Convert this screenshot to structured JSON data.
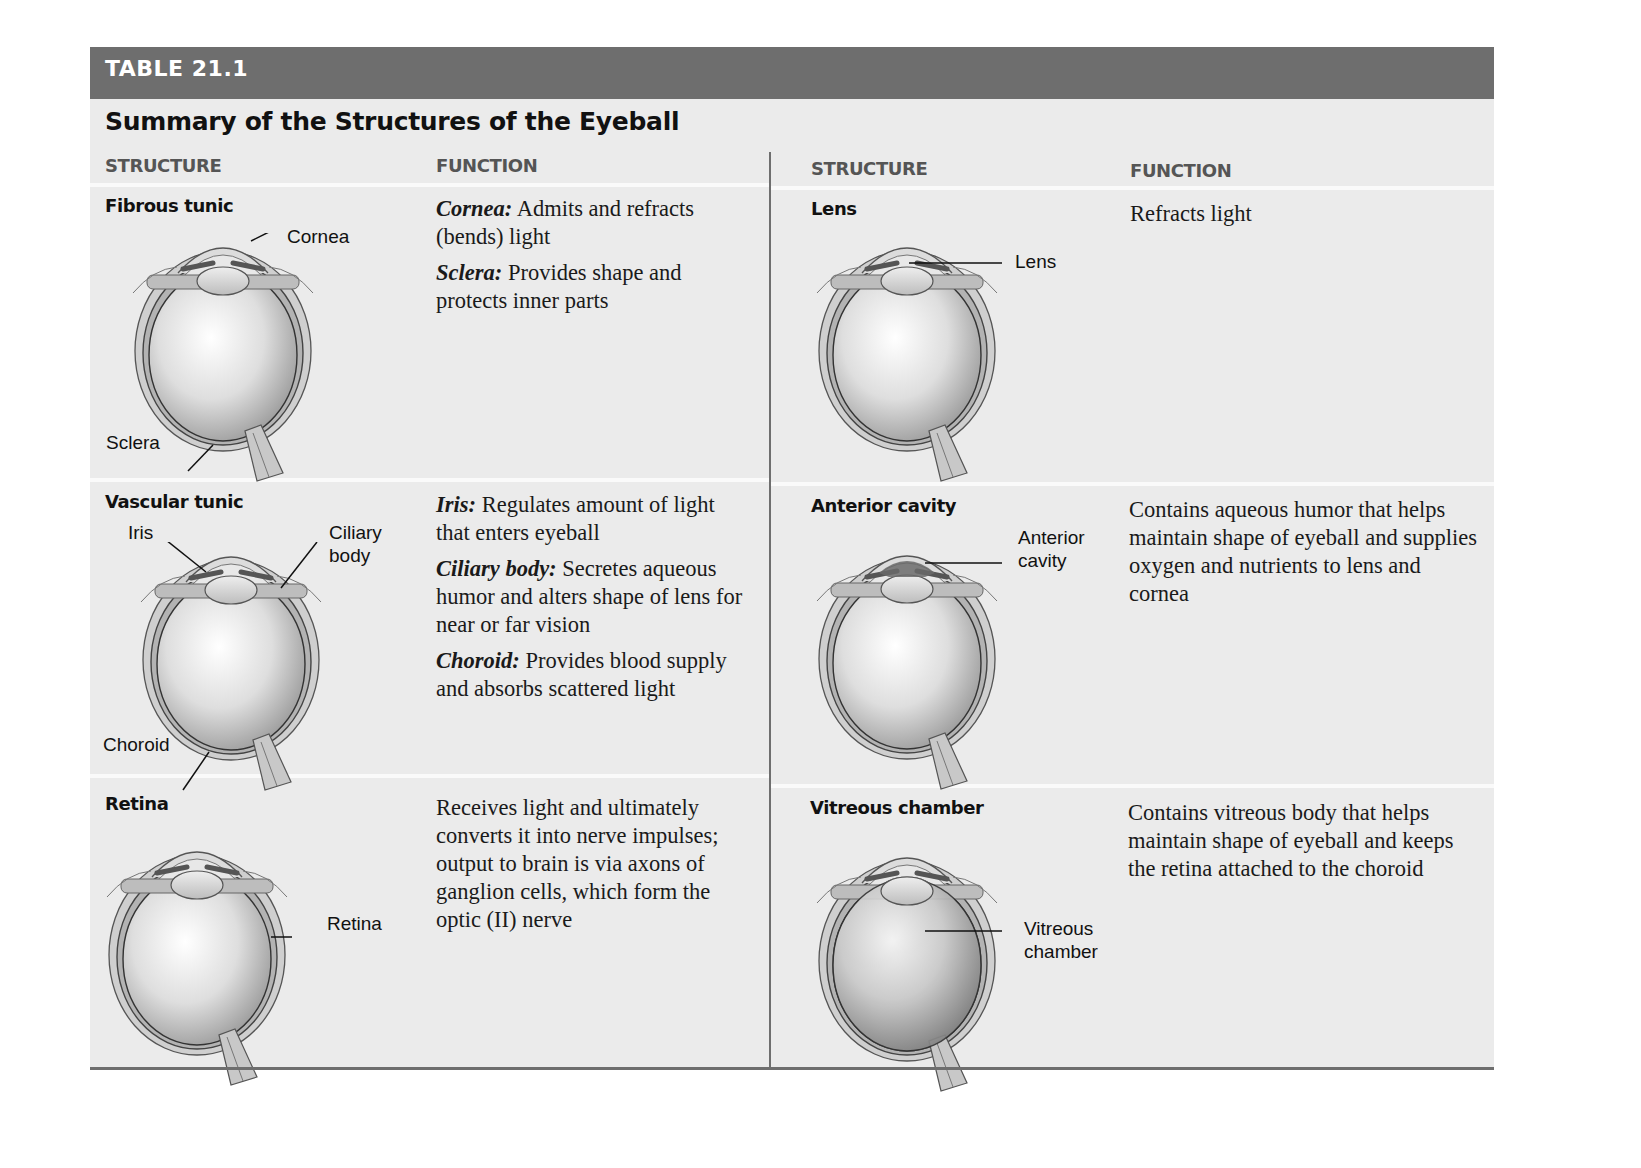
{
  "table": {
    "number": "TABLE 21.1",
    "title": "Summary of the Structures of the Eyeball",
    "columns": {
      "left": {
        "structure": "STRUCTURE",
        "function": "FUNCTION"
      },
      "right": {
        "structure": "STRUCTURE",
        "function": "FUNCTION"
      }
    },
    "rows_left": [
      {
        "structure": "Fibrous tunic",
        "labels": [
          "Cornea",
          "Sclera"
        ],
        "functions": [
          {
            "term": "Cornea:",
            "text": " Admits and refracts (bends) light"
          },
          {
            "term": "Sclera:",
            "text": " Provides shape and protects inner parts"
          }
        ]
      },
      {
        "structure": "Vascular tunic",
        "labels": [
          "Iris",
          "Ciliary body",
          "Choroid"
        ],
        "functions": [
          {
            "term": "Iris:",
            "text": " Regulates amount of light that enters eyeball"
          },
          {
            "term": "Ciliary body:",
            "text": " Secretes aqueous humor and alters shape of lens for near or far vision"
          },
          {
            "term": "Choroid:",
            "text": " Provides blood supply and absorbs scattered light"
          }
        ]
      },
      {
        "structure": "Retina",
        "labels": [
          "Retina"
        ],
        "functions": [
          {
            "term": "",
            "text": "Receives light and ultimately converts it into nerve impulses; output to brain is via axons of ganglion cells, which form the optic (II) nerve"
          }
        ]
      }
    ],
    "rows_right": [
      {
        "structure": "Lens",
        "labels": [
          "Lens"
        ],
        "functions": [
          {
            "term": "",
            "text": "Refracts light"
          }
        ]
      },
      {
        "structure": "Anterior cavity",
        "labels": [
          "Anterior cavity"
        ],
        "functions": [
          {
            "term": "",
            "text": "Contains aqueous humor that helps maintain shape of eyeball and supplies oxygen and nutrients to lens and cornea"
          }
        ]
      },
      {
        "structure": "Vitreous chamber",
        "labels": [
          "Vitreous chamber"
        ],
        "functions": [
          {
            "term": "",
            "text": "Contains vitreous body that helps maintain shape of eyeball and keeps the retina attached to the choroid"
          }
        ]
      }
    ]
  },
  "colors": {
    "header_bar": "#6e6e6e",
    "table_bg": "#ebebeb",
    "column_head": "#555555"
  }
}
